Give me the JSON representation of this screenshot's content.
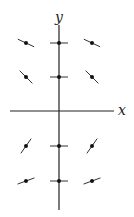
{
  "diagram": {
    "type": "slope-field",
    "axes": {
      "x_label": "x",
      "y_label": "y",
      "color": "#222222"
    },
    "grid": {
      "columns_px": [
        26,
        59,
        92
      ],
      "rows_px": [
        43,
        77,
        146,
        181
      ]
    },
    "segments": [
      {
        "cx": 26,
        "cy": 43,
        "angle_deg": 25
      },
      {
        "cx": 59,
        "cy": 43,
        "angle_deg": 0
      },
      {
        "cx": 92,
        "cy": 43,
        "angle_deg": 25
      },
      {
        "cx": 26,
        "cy": 77,
        "angle_deg": 45
      },
      {
        "cx": 59,
        "cy": 77,
        "angle_deg": 0
      },
      {
        "cx": 92,
        "cy": 77,
        "angle_deg": 45
      },
      {
        "cx": 26,
        "cy": 146,
        "angle_deg": -55
      },
      {
        "cx": 59,
        "cy": 146,
        "angle_deg": 0
      },
      {
        "cx": 92,
        "cy": 146,
        "angle_deg": -55
      },
      {
        "cx": 26,
        "cy": 181,
        "angle_deg": -20
      },
      {
        "cx": 59,
        "cy": 181,
        "angle_deg": 0
      },
      {
        "cx": 92,
        "cy": 181,
        "angle_deg": -20
      }
    ],
    "colors": {
      "segment": "#333333",
      "dot": "#111111"
    }
  }
}
